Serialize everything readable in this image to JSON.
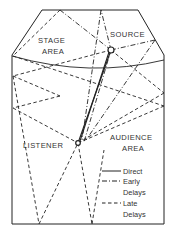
{
  "diagram": {
    "labels": {
      "stage_line1": "STAGE",
      "stage_line2": "AREA",
      "source": "SOURCE",
      "listener": "LISTENER",
      "audience_line1": "AUDIENCE",
      "audience_line2": "AREA"
    },
    "legend": [
      {
        "style": "solid",
        "line1": "Direct",
        "line2": ""
      },
      {
        "style": "dash-dot",
        "line1": "Early",
        "line2": "Delays"
      },
      {
        "style": "dashed",
        "line1": "Late",
        "line2": "Delays"
      }
    ],
    "colors": {
      "ink": "#222222",
      "background": "#ffffff"
    }
  }
}
